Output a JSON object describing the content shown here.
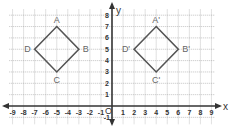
{
  "diagram": {
    "type": "coordinate-plane-translation",
    "x_range": [
      -9,
      9
    ],
    "y_range": [
      -1,
      8
    ],
    "axis_labels": {
      "x": "x",
      "y": "y"
    },
    "origin_label": "O",
    "x_ticks": [
      "-9",
      "-8",
      "-7",
      "-6",
      "-5",
      "-4",
      "-3",
      "-2",
      "-1",
      "1",
      "2",
      "3",
      "4",
      "5",
      "6",
      "7",
      "8",
      "9"
    ],
    "y_ticks": [
      "-1",
      "1",
      "2",
      "3",
      "4",
      "5",
      "6",
      "7",
      "8"
    ],
    "colors": {
      "grid": "#9a9a9a",
      "axis": "#333333",
      "shape": "#555555",
      "label": "#666666"
    },
    "shapes": [
      {
        "name": "ABCD",
        "vertices": [
          {
            "label": "A",
            "x": -5,
            "y": 7
          },
          {
            "label": "B",
            "x": -3,
            "y": 5
          },
          {
            "label": "C",
            "x": -5,
            "y": 3
          },
          {
            "label": "D",
            "x": -7,
            "y": 5
          }
        ]
      },
      {
        "name": "A'B'C'D'",
        "vertices": [
          {
            "label": "A'",
            "x": 4,
            "y": 7
          },
          {
            "label": "B'",
            "x": 6,
            "y": 5
          },
          {
            "label": "C'",
            "x": 4,
            "y": 3
          },
          {
            "label": "D'",
            "x": 2,
            "y": 5
          }
        ]
      }
    ]
  }
}
